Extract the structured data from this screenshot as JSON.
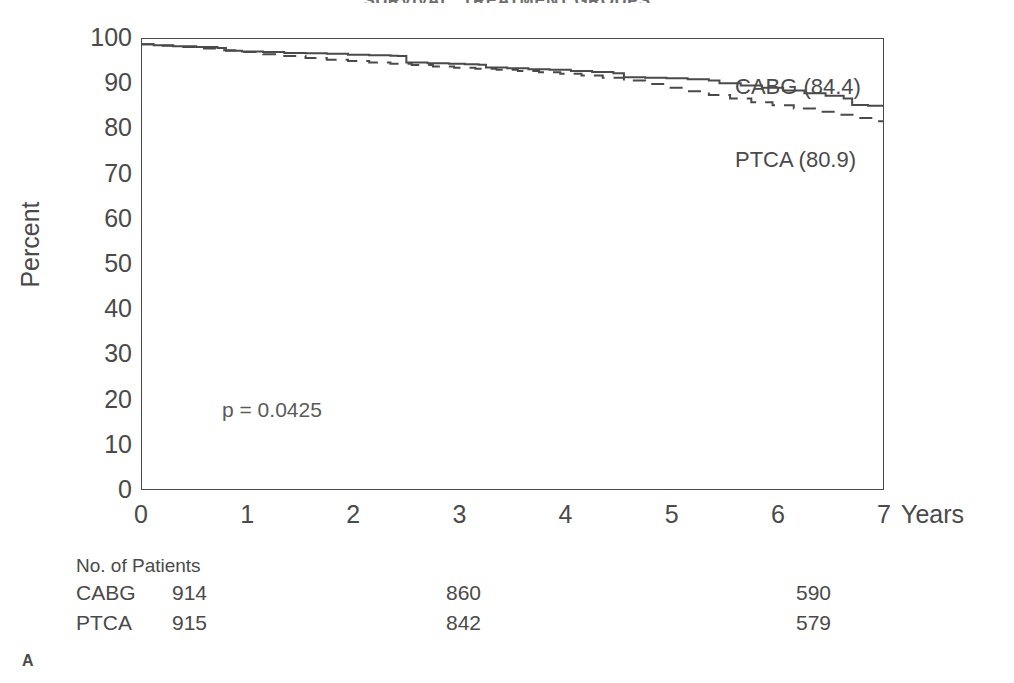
{
  "figure": {
    "title": "SURVIVAL: TREATMENT GROUPS",
    "panel_letter": "A"
  },
  "axes": {
    "y_title": "Percent",
    "x_title": "Years",
    "y_ticks": [
      "0",
      "10",
      "20",
      "30",
      "40",
      "50",
      "60",
      "70",
      "80",
      "90",
      "100"
    ],
    "x_ticks": [
      "0",
      "1",
      "2",
      "3",
      "4",
      "5",
      "6",
      "7"
    ]
  },
  "annotations": {
    "pvalue": "p = 0.0425",
    "cabg_label": "CABG (84.4)",
    "ptca_label": "PTCA (80.9)"
  },
  "risk_table": {
    "title": "No. of Patients",
    "rows": [
      {
        "arm": "CABG",
        "c0": "914",
        "c1": "860",
        "c2": "590"
      },
      {
        "arm": "PTCA",
        "c0": "915",
        "c1": "842",
        "c2": "579"
      }
    ]
  },
  "colors": {
    "ink": "#4a4a4a",
    "background": "#ffffff"
  },
  "chart_data": {
    "type": "line",
    "title": "SURVIVAL: TREATMENT GROUPS",
    "xlabel": "Years",
    "ylabel": "Percent",
    "xlim": [
      0,
      7
    ],
    "ylim": [
      0,
      100
    ],
    "grid": false,
    "legend": "in-plot curve labels at right",
    "x_ticks": [
      0,
      1,
      2,
      3,
      4,
      5,
      6,
      7
    ],
    "y_ticks": [
      0,
      10,
      20,
      30,
      40,
      50,
      60,
      70,
      80,
      90,
      100
    ],
    "x_minor_tick_interval": 0.5,
    "annotations": [
      {
        "text": "p = 0.0425",
        "x": 0.8,
        "y": 19
      }
    ],
    "series": [
      {
        "name": "CABG",
        "style": "solid",
        "final_value": 84.4,
        "label": "CABG (84.4)",
        "n_at_risk": [
          914,
          860,
          590
        ],
        "points": [
          [
            0.0,
            98.6
          ],
          [
            0.12,
            98.4
          ],
          [
            0.3,
            98.2
          ],
          [
            0.52,
            98.0
          ],
          [
            0.72,
            97.8
          ],
          [
            0.8,
            97.2
          ],
          [
            0.95,
            97.0
          ],
          [
            1.15,
            96.9
          ],
          [
            1.35,
            96.7
          ],
          [
            1.55,
            96.6
          ],
          [
            1.75,
            96.5
          ],
          [
            1.95,
            96.3
          ],
          [
            2.15,
            96.2
          ],
          [
            2.35,
            96.1
          ],
          [
            2.42,
            96.0
          ],
          [
            2.5,
            94.6
          ],
          [
            2.7,
            94.4
          ],
          [
            2.9,
            94.3
          ],
          [
            3.05,
            94.2
          ],
          [
            3.18,
            94.1
          ],
          [
            3.25,
            93.5
          ],
          [
            3.45,
            93.3
          ],
          [
            3.65,
            93.1
          ],
          [
            3.85,
            93.0
          ],
          [
            4.05,
            92.7
          ],
          [
            4.25,
            92.5
          ],
          [
            4.45,
            92.2
          ],
          [
            4.55,
            91.3
          ],
          [
            4.75,
            91.2
          ],
          [
            4.95,
            91.1
          ],
          [
            5.15,
            90.9
          ],
          [
            5.35,
            90.6
          ],
          [
            5.45,
            90.0
          ],
          [
            5.65,
            89.5
          ],
          [
            5.85,
            89.0
          ],
          [
            6.05,
            88.4
          ],
          [
            6.25,
            87.8
          ],
          [
            6.45,
            87.2
          ],
          [
            6.62,
            86.6
          ],
          [
            6.7,
            85.2
          ],
          [
            6.85,
            85.0
          ],
          [
            7.0,
            84.4
          ]
        ]
      },
      {
        "name": "PTCA",
        "style": "dashed",
        "final_value": 80.9,
        "label": "PTCA (80.9)",
        "n_at_risk": [
          915,
          842,
          579
        ],
        "points": [
          [
            0.0,
            98.6
          ],
          [
            0.15,
            98.3
          ],
          [
            0.35,
            98.0
          ],
          [
            0.55,
            97.7
          ],
          [
            0.75,
            97.3
          ],
          [
            0.95,
            96.9
          ],
          [
            1.15,
            96.4
          ],
          [
            1.35,
            96.0
          ],
          [
            1.55,
            95.6
          ],
          [
            1.75,
            95.2
          ],
          [
            1.95,
            94.9
          ],
          [
            2.15,
            94.6
          ],
          [
            2.35,
            94.3
          ],
          [
            2.55,
            94.0
          ],
          [
            2.75,
            93.7
          ],
          [
            2.95,
            93.4
          ],
          [
            3.15,
            93.2
          ],
          [
            3.35,
            93.0
          ],
          [
            3.55,
            92.7
          ],
          [
            3.75,
            92.4
          ],
          [
            3.95,
            92.1
          ],
          [
            4.15,
            91.7
          ],
          [
            4.35,
            91.2
          ],
          [
            4.55,
            90.6
          ],
          [
            4.75,
            89.8
          ],
          [
            4.95,
            89.0
          ],
          [
            5.15,
            88.2
          ],
          [
            5.35,
            87.4
          ],
          [
            5.55,
            86.6
          ],
          [
            5.75,
            85.8
          ],
          [
            5.95,
            85.1
          ],
          [
            6.15,
            84.4
          ],
          [
            6.35,
            83.7
          ],
          [
            6.55,
            83.0
          ],
          [
            6.75,
            82.3
          ],
          [
            6.9,
            81.6
          ],
          [
            7.0,
            80.9
          ]
        ]
      }
    ]
  }
}
